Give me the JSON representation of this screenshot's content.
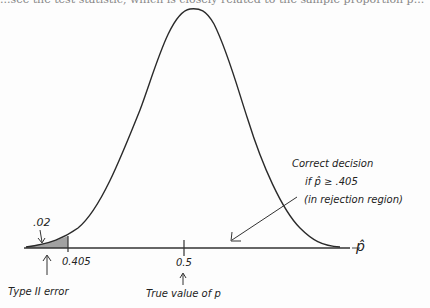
{
  "header": {
    "cut_off_text": "...see the test statistic, which is closely related to the sample proportion p..."
  },
  "diagram": {
    "type": "normal-distribution-sketch",
    "x_axis_label": "p̂",
    "ticks": [
      {
        "label": "0.405",
        "role": "critical-value"
      },
      {
        "label": "0.5",
        "role": "true-value"
      }
    ],
    "shaded_area_label": ".02",
    "annotations": {
      "type_ii_error": "Type II error",
      "true_value": "True value of p",
      "correct_decision_line1": "Correct decision",
      "correct_decision_line2": "if p̂ ≥ .405",
      "correct_decision_line3": "(in rejection region)"
    },
    "colors": {
      "ink": "#2a2a2a",
      "paper": "#fdfdfd"
    }
  }
}
